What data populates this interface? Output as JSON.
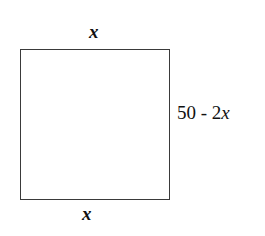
{
  "diagram": {
    "shape": "rectangle",
    "labels": {
      "top": "x",
      "bottom": "x",
      "right_constant": "50 - 2",
      "right_variable": "x"
    }
  }
}
